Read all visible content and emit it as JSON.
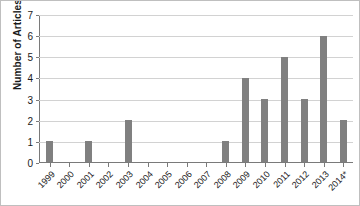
{
  "chart_data": {
    "type": "bar",
    "title": "",
    "xlabel": "",
    "ylabel": "Number of Articles",
    "categories": [
      "1999",
      "2000",
      "2001",
      "2002",
      "2003",
      "2004",
      "2005",
      "2006",
      "2007",
      "2008",
      "2009",
      "2010",
      "2011",
      "2012",
      "2013",
      "2014*"
    ],
    "values": [
      1,
      0,
      1,
      0,
      2,
      0,
      0,
      0,
      0,
      1,
      4,
      3,
      5,
      3,
      6,
      2
    ],
    "ylim": [
      0,
      7
    ],
    "yticks": [
      "0",
      "1",
      "2",
      "3",
      "4",
      "5",
      "6",
      "7"
    ],
    "grid": true,
    "legend": false,
    "bar_color": "#808080",
    "gridline_color": "#d2d2d2",
    "axis_color": "#7a7a7a"
  }
}
